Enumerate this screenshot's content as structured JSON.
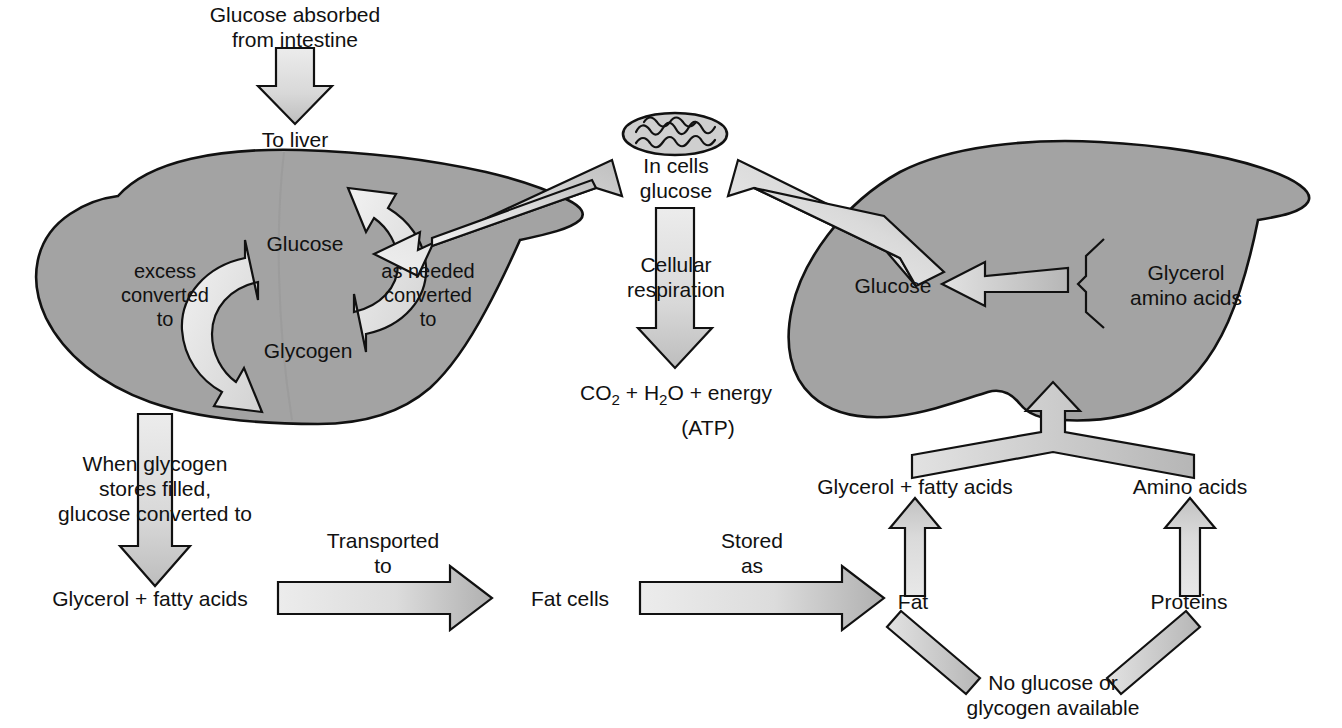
{
  "diagram": {
    "colors": {
      "organ_fill": "#a3a3a3",
      "arrow_light": "#e4e4e4",
      "arrow_dark": "#b4b4b4",
      "outline": "#111111",
      "background": "#ffffff"
    },
    "labels": {
      "glucose_absorbed": "Glucose absorbed\nfrom intestine",
      "to_liver": "To liver",
      "liver_glucose": "Glucose",
      "liver_glycogen": "Glycogen",
      "excess_converted_to": "excess\nconverted\nto",
      "as_needed_converted_to": "as needed\nconverted\nto",
      "in_cells_glucose": "In cells\nglucose",
      "cellular_respiration": "Cellular\nrespiration",
      "respiration_products_line1": "CO2 + H2O + energy",
      "respiration_products_line2": "(ATP)",
      "right_glucose": "Glucose",
      "glycerol_amino_acids": "Glycerol\namino acids",
      "when_glycogen_stores": "When glycogen\nstores filled,\nglucose converted to",
      "glycerol_fatty_acids_left": "Glycerol + fatty acids",
      "transported_to": "Transported\nto",
      "fat_cells": "Fat cells",
      "stored_as": "Stored\nas",
      "fat": "Fat",
      "proteins": "Proteins",
      "glycerol_fatty_acids_right": "Glycerol + fatty acids",
      "amino_acids": "Amino acids",
      "no_glucose_available": "No glucose or\nglycogen available"
    },
    "organs": [
      {
        "name": "liver-left",
        "label": "Liver"
      },
      {
        "name": "liver-right",
        "label": "Liver"
      }
    ],
    "icons": [
      {
        "name": "mitochondrion-icon",
        "label": "mitochondrion"
      }
    ]
  }
}
